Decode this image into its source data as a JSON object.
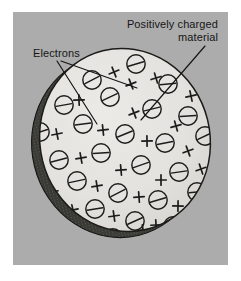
{
  "figure": {
    "kind": "physics-illustration",
    "caption_labels": {
      "electrons": "Electrons",
      "positive_line1": "Positively charged",
      "positive_line2": "material"
    },
    "colors": {
      "page_background": "#ffffff",
      "panel_background": "#acacac",
      "disc_face": "#e3e2de",
      "disc_edge_shadow": "#3a3a38",
      "ink": "#161616"
    },
    "diagram": {
      "object_name": "charged-disc",
      "disc": {
        "center_x": 112,
        "center_y": 128,
        "radius_x": 85,
        "radius_y": 92,
        "rotation_deg": -14
      },
      "symbol_legend": [
        {
          "glyph": "circled-minus",
          "meaning": "Electrons",
          "count": 34
        },
        {
          "glyph": "plus-cross",
          "meaning": "Positively charged material",
          "count": 30
        }
      ],
      "electrons": [
        [
          79,
          68
        ],
        [
          123,
          52
        ],
        [
          155,
          72
        ],
        [
          186,
          63
        ],
        [
          51,
          93
        ],
        [
          97,
          85
        ],
        [
          139,
          97
        ],
        [
          175,
          104
        ],
        [
          27,
          120
        ],
        [
          70,
          112
        ],
        [
          112,
          122
        ],
        [
          152,
          131
        ],
        [
          192,
          124
        ],
        [
          46,
          148
        ],
        [
          88,
          141
        ],
        [
          128,
          153
        ],
        [
          166,
          160
        ],
        [
          24,
          176
        ],
        [
          64,
          169
        ],
        [
          105,
          181
        ],
        [
          145,
          188
        ],
        [
          184,
          180
        ],
        [
          41,
          203
        ],
        [
          82,
          197
        ],
        [
          122,
          209
        ],
        [
          160,
          214
        ],
        [
          60,
          228
        ],
        [
          100,
          226
        ],
        [
          138,
          236
        ],
        [
          30,
          60
        ],
        [
          206,
          150
        ],
        [
          197,
          205
        ],
        [
          75,
          248
        ],
        [
          116,
          247
        ]
      ],
      "positive_marks": [
        [
          101,
          60
        ],
        [
          143,
          66
        ],
        [
          178,
          84
        ],
        [
          200,
          95
        ],
        [
          66,
          88
        ],
        [
          121,
          101
        ],
        [
          163,
          114
        ],
        [
          44,
          122
        ],
        [
          90,
          118
        ],
        [
          134,
          129
        ],
        [
          175,
          139
        ],
        [
          22,
          152
        ],
        [
          68,
          146
        ],
        [
          108,
          158
        ],
        [
          148,
          168
        ],
        [
          188,
          157
        ],
        [
          40,
          180
        ],
        [
          84,
          174
        ],
        [
          126,
          185
        ],
        [
          165,
          194
        ],
        [
          20,
          200
        ],
        [
          60,
          198
        ],
        [
          101,
          204
        ],
        [
          143,
          213
        ],
        [
          180,
          228
        ],
        [
          55,
          225
        ],
        [
          96,
          232
        ],
        [
          130,
          218
        ],
        [
          36,
          232
        ],
        [
          118,
          72
        ]
      ],
      "leader_lines": [
        {
          "from": [
            44,
            49
          ],
          "to": [
            84,
            112
          ],
          "name": "electrons-pointer-left"
        },
        {
          "from": [
            48,
            49
          ],
          "to": [
            124,
            76
          ],
          "name": "electrons-pointer-right"
        },
        {
          "from": [
            192,
            34
          ],
          "to": [
            128,
            108
          ],
          "name": "positive-material-pointer"
        }
      ]
    }
  }
}
